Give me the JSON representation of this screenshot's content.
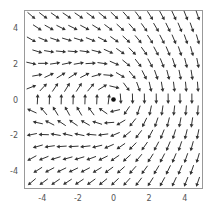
{
  "chart_data": {
    "type": "quiver",
    "title": "",
    "xlabel": "",
    "ylabel": "",
    "xlim": [
      -5,
      5
    ],
    "ylim": [
      -5,
      5
    ],
    "grid": false,
    "legend": null,
    "x_ticks": [
      -4,
      -2,
      0,
      2,
      4
    ],
    "y_ticks": [
      -4,
      -2,
      0,
      2,
      4
    ],
    "x_tick_labels": [
      "-4",
      "-2",
      "0",
      "2",
      "4"
    ],
    "y_tick_labels": [
      "-4",
      "-2",
      "0",
      "2",
      "4"
    ],
    "field_description": "Point vortex (clockwise) at origin superposed on uniform downward flow; arrows normalized to unit length",
    "field_model": {
      "uniform_flow": [
        0,
        -1
      ],
      "vortex_center": [
        0,
        0
      ],
      "vortex_strength_over_U": 5.0,
      "rotation": "clockwise"
    },
    "marker": {
      "x": 0,
      "y": 0,
      "shape": "dot",
      "color": "#111111"
    },
    "grid_layout": {
      "rows": 15,
      "row_y_start": 4.7,
      "row_spacing": 0.667,
      "odd_row_x_start": -4.6,
      "odd_row_count": 15,
      "even_row_x_start": -4.267,
      "even_row_count": 14,
      "col_spacing": 0.667
    },
    "sample_vectors": [
      {
        "x": -4,
        "y": 4,
        "direction": "down-right"
      },
      {
        "x": -4,
        "y": 2,
        "direction": "right"
      },
      {
        "x": -4,
        "y": 0,
        "direction": "up"
      },
      {
        "x": -4,
        "y": -2,
        "direction": "left"
      },
      {
        "x": -4,
        "y": -4,
        "direction": "down-left"
      },
      {
        "x": 2,
        "y": 0,
        "direction": "down"
      },
      {
        "x": 4,
        "y": 4,
        "direction": "down"
      },
      {
        "x": 4,
        "y": -4,
        "direction": "down"
      },
      {
        "x": -1,
        "y": 1,
        "direction": "right"
      },
      {
        "x": -1,
        "y": -1,
        "direction": "left"
      }
    ],
    "colors": {
      "arrow": "#333333",
      "frame": "#999999",
      "tick_label": "#555555"
    }
  }
}
